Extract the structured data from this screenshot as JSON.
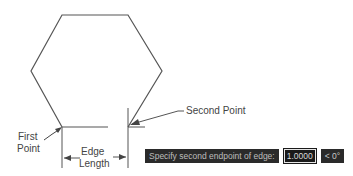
{
  "diagram": {
    "shape": "hexagon",
    "labels": {
      "second_point": "Second Point",
      "first_point_line1": "First",
      "first_point_line2": "Point",
      "edge_length_line1": "Edge",
      "edge_length_line2": "Length"
    }
  },
  "command_line": {
    "prompt": "Specify second endpoint of edge:",
    "input_value": "1.0000",
    "angle": "< 0°"
  }
}
